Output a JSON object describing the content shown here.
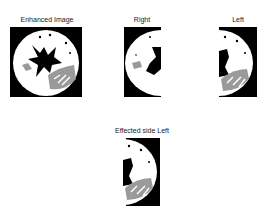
{
  "figure": {
    "panels": [
      {
        "id": "enhanced",
        "title": "Enhanced Image"
      },
      {
        "id": "right",
        "title": "Right"
      },
      {
        "id": "left",
        "title": "Left"
      },
      {
        "id": "effected",
        "title": "Effected side Left"
      }
    ]
  },
  "colors": {
    "background": "#ffffff",
    "brain": "#ffffff",
    "mask": "#000000",
    "lesion": "#9a9a9a"
  }
}
